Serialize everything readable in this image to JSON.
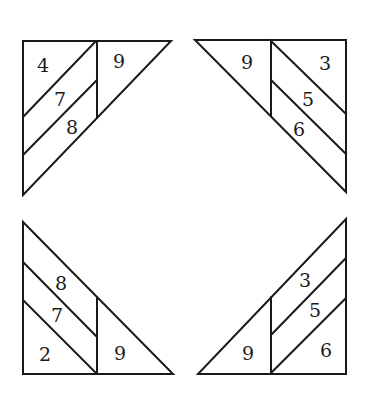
{
  "figure": {
    "type": "diagram",
    "stroke_color": "#1a1a1a",
    "background": "#ffffff"
  },
  "triangles": [
    {
      "position": "top-left",
      "labels": [
        {
          "text": "4",
          "x": 43,
          "y": 65
        },
        {
          "text": "7",
          "x": 60,
          "y": 99
        },
        {
          "text": "8",
          "x": 72,
          "y": 127
        },
        {
          "text": "9",
          "x": 119,
          "y": 61
        }
      ]
    },
    {
      "position": "top-right",
      "labels": [
        {
          "text": "9",
          "x": 247,
          "y": 62
        },
        {
          "text": "3",
          "x": 325,
          "y": 63
        },
        {
          "text": "5",
          "x": 308,
          "y": 99
        },
        {
          "text": "6",
          "x": 299,
          "y": 129
        }
      ]
    },
    {
      "position": "bottom-left",
      "labels": [
        {
          "text": "8",
          "x": 61,
          "y": 283
        },
        {
          "text": "7",
          "x": 57,
          "y": 315
        },
        {
          "text": "2",
          "x": 45,
          "y": 354
        },
        {
          "text": "9",
          "x": 120,
          "y": 353
        }
      ]
    },
    {
      "position": "bottom-right",
      "labels": [
        {
          "text": "3",
          "x": 305,
          "y": 280
        },
        {
          "text": "5",
          "x": 315,
          "y": 310
        },
        {
          "text": "9",
          "x": 248,
          "y": 353
        },
        {
          "text": "6",
          "x": 326,
          "y": 350
        }
      ]
    }
  ]
}
